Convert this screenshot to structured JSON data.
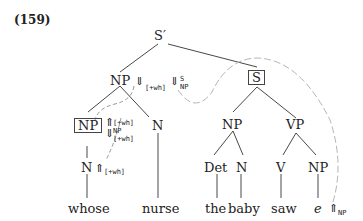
{
  "example_number": "(159)",
  "nodes": {
    "root": "S′",
    "np_top": "NP",
    "s_boxed": "S",
    "np_boxed": "NP",
    "n_nurse": "N",
    "n_whose": "N",
    "np_subj": "NP",
    "vp": "VP",
    "det": "Det",
    "n_baby": "N",
    "v": "V",
    "np_obj": "NP"
  },
  "words": {
    "whose": "whose",
    "nurse": "nurse",
    "the": "the",
    "baby": "baby",
    "saw": "saw",
    "e": "e"
  },
  "annotations": {
    "np_top_down_feat": "[+wh]",
    "np_top_slash_sup": "S",
    "np_top_slash_sub": "NP",
    "np_boxed_up_feat": "[+wh]",
    "np_boxed_down_sup": "NP",
    "np_boxed_down_sub": "[+wh]",
    "n_whose_up_feat": "[+wh]",
    "e_up_sub": "NP"
  },
  "arrows": {
    "down": "⇓",
    "up": "⇑"
  },
  "colors": {
    "line": "#333333",
    "dash": "#aaaaaa"
  }
}
